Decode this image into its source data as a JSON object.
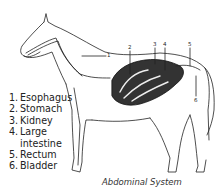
{
  "diagram": {
    "caption": "Abdominal System",
    "legend": [
      {
        "number": "1.",
        "label": "Esophagus"
      },
      {
        "number": "2.",
        "label": "Stomach"
      },
      {
        "number": "3.",
        "label": "Kidney"
      },
      {
        "number": "4.",
        "label": "Large"
      },
      {
        "number": "",
        "label": "intestine"
      },
      {
        "number": "5.",
        "label": "Rectum"
      },
      {
        "number": "6.",
        "label": "Bladder"
      }
    ],
    "callouts": [
      "1",
      "2",
      "3",
      "4",
      "5",
      "6"
    ]
  }
}
